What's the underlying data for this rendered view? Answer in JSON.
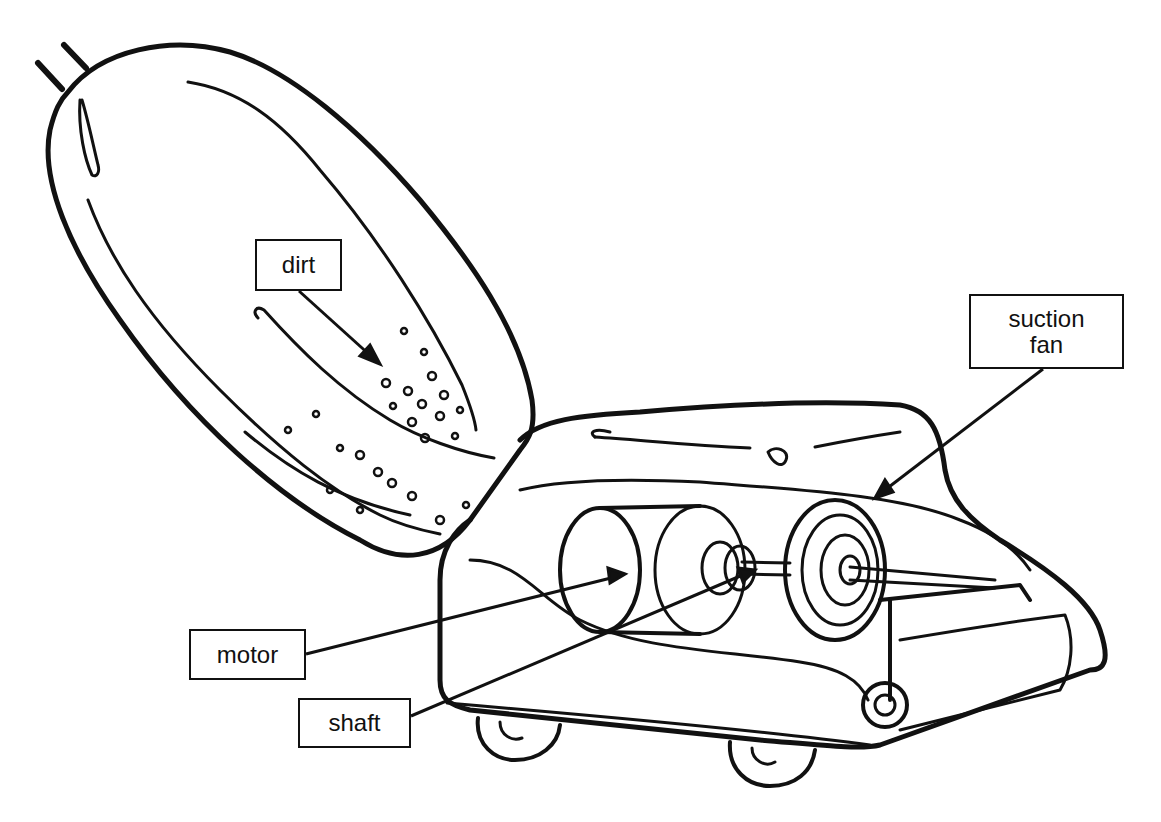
{
  "diagram": {
    "colors": {
      "ink": "#111111",
      "background": "#ffffff"
    },
    "labels": [
      {
        "id": "dirt",
        "text": "dirt",
        "box": {
          "x": 255,
          "y": 239,
          "w": 87,
          "h": 52
        }
      },
      {
        "id": "suction_fan",
        "text": "suction\nfan",
        "box": {
          "x": 969,
          "y": 294,
          "w": 155,
          "h": 75
        }
      },
      {
        "id": "motor",
        "text": "motor",
        "box": {
          "x": 189,
          "y": 629,
          "w": 117,
          "h": 51
        }
      },
      {
        "id": "shaft",
        "text": "shaft",
        "box": {
          "x": 298,
          "y": 698,
          "w": 113,
          "h": 50
        }
      }
    ]
  }
}
